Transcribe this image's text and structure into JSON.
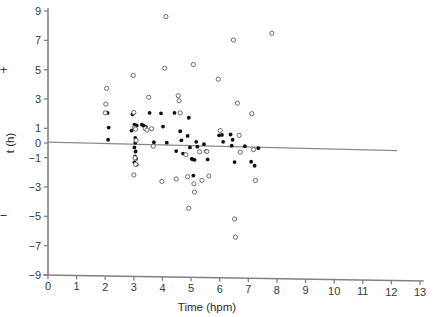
{
  "chart_data": {
    "type": "scatter",
    "title": "",
    "xlabel": "Time (hpm)",
    "ylabel": "t (h)",
    "xlim": [
      0,
      13
    ],
    "ylim": [
      -9,
      9
    ],
    "xticks": [
      0,
      1,
      2,
      3,
      4,
      5,
      6,
      7,
      8,
      9,
      10,
      11,
      12,
      13
    ],
    "xticklabels": [
      "0",
      "1",
      "2",
      "3",
      "4",
      "5",
      "6",
      "7",
      "8",
      "9",
      "10",
      "11",
      "12",
      "13"
    ],
    "yticks": [
      9,
      7,
      5,
      3,
      1,
      0,
      -1,
      -3,
      -5,
      -7,
      -9
    ],
    "yticklabels": [
      "9",
      "7",
      "5",
      "3",
      "1",
      "0",
      "−1",
      "−3",
      "−5",
      "−7",
      "−9"
    ],
    "grid": false,
    "legend_position": "none",
    "axis_annotations": [
      {
        "name": "plus-sign",
        "text": "+",
        "x_value": -1.55,
        "y_value": 5.0
      },
      {
        "name": "minus-sign",
        "text": "−",
        "x_value": -1.55,
        "y_value": -5.0
      }
    ],
    "trend_line": {
      "name": "regression-line",
      "x_start": 0.0,
      "y_start": 0.06,
      "x_end": 12.2,
      "y_end": -0.52,
      "color": "#8a8a8d"
    },
    "series": [
      {
        "name": "filled-points",
        "marker": "filled-circle",
        "color": "#111113",
        "points": [
          [
            2.08,
            2.05
          ],
          [
            2.12,
            1.05
          ],
          [
            2.1,
            0.22
          ],
          [
            2.95,
            1.95
          ],
          [
            2.92,
            0.85
          ],
          [
            3.02,
            1.25
          ],
          [
            3.1,
            1.2
          ],
          [
            3.05,
            0.35
          ],
          [
            3.05,
            0.02
          ],
          [
            3.02,
            -0.3
          ],
          [
            3.06,
            -0.58
          ],
          [
            3.04,
            -0.92
          ],
          [
            3.08,
            -1.08
          ],
          [
            3.02,
            -1.32
          ],
          [
            3.1,
            -1.48
          ],
          [
            3.28,
            1.25
          ],
          [
            3.34,
            1.18
          ],
          [
            3.42,
            1.1
          ],
          [
            3.55,
            2.05
          ],
          [
            3.62,
            0.95
          ],
          [
            3.7,
            0.05
          ],
          [
            3.95,
            2.02
          ],
          [
            4.02,
            1.12
          ],
          [
            4.15,
            0.02
          ],
          [
            4.42,
            2.05
          ],
          [
            4.48,
            -0.55
          ],
          [
            4.62,
            0.8
          ],
          [
            4.66,
            0.18
          ],
          [
            4.72,
            -0.72
          ],
          [
            4.92,
            1.72
          ],
          [
            4.88,
            0.48
          ],
          [
            4.96,
            -0.3
          ],
          [
            5.02,
            -1.08
          ],
          [
            5.06,
            -1.12
          ],
          [
            5.12,
            -1.15
          ],
          [
            5.08,
            -2.22
          ],
          [
            5.18,
            0.08
          ],
          [
            5.22,
            -0.25
          ],
          [
            5.45,
            -0.08
          ],
          [
            5.52,
            -0.55
          ],
          [
            5.58,
            -1.12
          ],
          [
            5.98,
            0.52
          ],
          [
            6.08,
            0.55
          ],
          [
            6.12,
            0.08
          ],
          [
            6.38,
            0.58
          ],
          [
            6.45,
            0.22
          ],
          [
            6.42,
            -0.18
          ],
          [
            6.52,
            -1.3
          ],
          [
            6.88,
            -0.22
          ],
          [
            7.1,
            -1.28
          ],
          [
            7.22,
            -1.55
          ],
          [
            7.35,
            -0.35
          ]
        ]
      },
      {
        "name": "open-points",
        "marker": "open-circle",
        "color": "#5c5c60",
        "points": [
          [
            2.05,
            3.72
          ],
          [
            2.02,
            2.65
          ],
          [
            2.0,
            2.05
          ],
          [
            2.98,
            4.6
          ],
          [
            3.0,
            2.08
          ],
          [
            3.02,
            1.02
          ],
          [
            3.06,
            0.95
          ],
          [
            3.08,
            0.18
          ],
          [
            3.04,
            -1.02
          ],
          [
            3.06,
            -1.45
          ],
          [
            3.0,
            -2.18
          ],
          [
            3.4,
            0.98
          ],
          [
            3.46,
            0.88
          ],
          [
            3.52,
            3.12
          ],
          [
            3.62,
            0.98
          ],
          [
            3.68,
            -0.22
          ],
          [
            4.12,
            8.62
          ],
          [
            4.08,
            5.1
          ],
          [
            3.98,
            -2.62
          ],
          [
            4.55,
            3.22
          ],
          [
            4.58,
            2.88
          ],
          [
            4.62,
            2.05
          ],
          [
            4.48,
            -2.45
          ],
          [
            4.82,
            -0.8
          ],
          [
            4.88,
            -2.3
          ],
          [
            4.92,
            -4.45
          ],
          [
            5.08,
            5.35
          ],
          [
            5.1,
            -2.78
          ],
          [
            5.12,
            -3.35
          ],
          [
            5.3,
            -0.6
          ],
          [
            5.38,
            -2.55
          ],
          [
            5.55,
            -0.58
          ],
          [
            5.62,
            -2.25
          ],
          [
            5.95,
            4.35
          ],
          [
            6.02,
            0.85
          ],
          [
            6.48,
            7.02
          ],
          [
            6.52,
            -5.18
          ],
          [
            6.55,
            -6.42
          ],
          [
            6.62,
            2.72
          ],
          [
            6.68,
            0.52
          ],
          [
            6.72,
            -0.62
          ],
          [
            7.12,
            2.0
          ],
          [
            7.18,
            -0.45
          ],
          [
            7.25,
            -2.55
          ],
          [
            7.82,
            7.48
          ]
        ]
      }
    ]
  }
}
